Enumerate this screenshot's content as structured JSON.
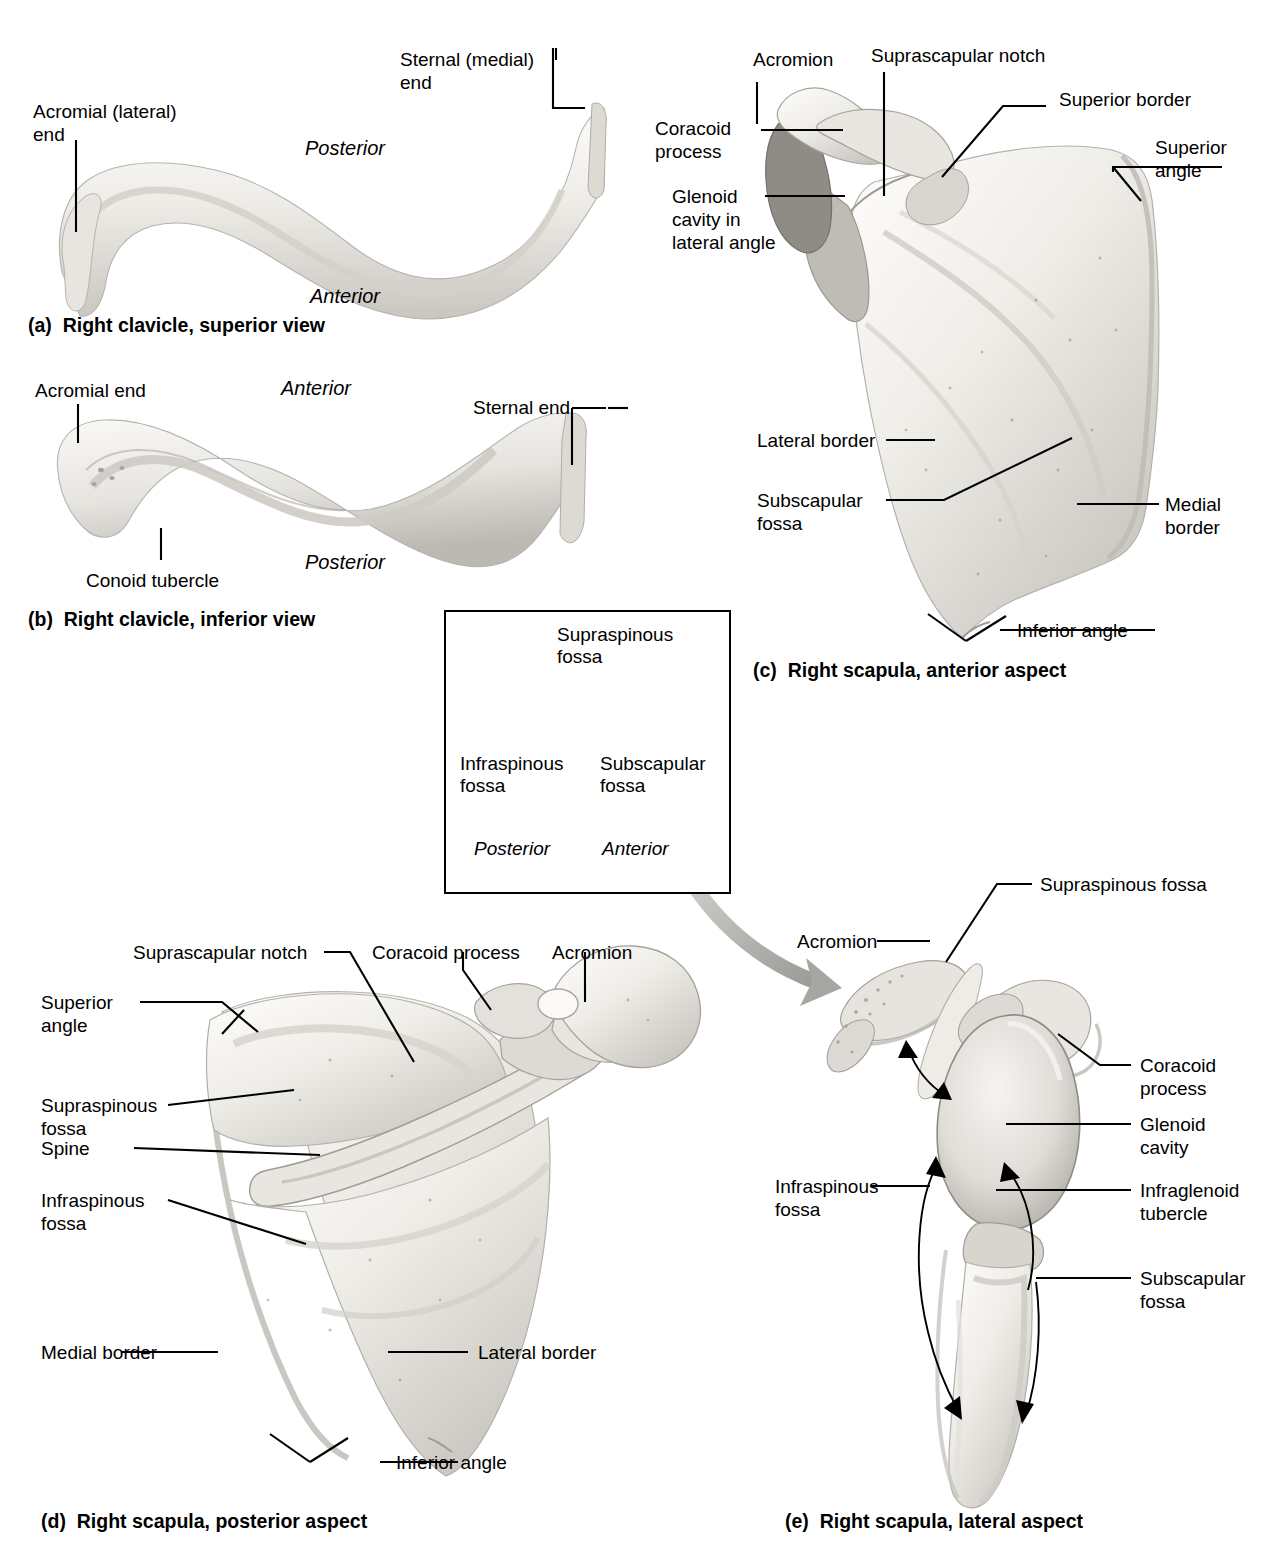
{
  "figure": {
    "background": "#ffffff",
    "bone_fill": "#f0eeea",
    "bone_shadow": "#b9b6b0",
    "inset_bar_fill": "#d4d2cd",
    "arrow_gray": "#a8a6a2"
  },
  "panels": [
    {
      "id": "a",
      "caption": "(a)  Right clavicle, superior view",
      "labels": [
        {
          "name": "acromial-lateral-end",
          "text": "Acromial (lateral)\nend"
        },
        {
          "name": "sternal-medial-end",
          "text": "Sternal (medial)\nend"
        },
        {
          "name": "posterior",
          "text": "Posterior",
          "italic": true
        },
        {
          "name": "anterior",
          "text": "Anterior",
          "italic": true
        }
      ]
    },
    {
      "id": "b",
      "caption": "(b)  Right clavicle, inferior view",
      "labels": [
        {
          "name": "acromial-end",
          "text": "Acromial end"
        },
        {
          "name": "anterior",
          "text": "Anterior",
          "italic": true
        },
        {
          "name": "sternal-end",
          "text": "Sternal end"
        },
        {
          "name": "posterior",
          "text": "Posterior",
          "italic": true
        },
        {
          "name": "conoid-tubercle",
          "text": "Conoid tubercle"
        }
      ]
    },
    {
      "id": "c",
      "caption": "(c)  Right scapula, anterior aspect",
      "labels": [
        {
          "name": "acromion",
          "text": "Acromion"
        },
        {
          "name": "suprascapular-notch",
          "text": "Suprascapular notch"
        },
        {
          "name": "superior-border",
          "text": "Superior border"
        },
        {
          "name": "coracoid-process",
          "text": "Coracoid\nprocess"
        },
        {
          "name": "superior-angle",
          "text": "Superior\nangle"
        },
        {
          "name": "glenoid-cavity-lateral-angle",
          "text": "Glenoid\ncavity in\nlateral angle"
        },
        {
          "name": "lateral-border",
          "text": "Lateral border"
        },
        {
          "name": "subscapular-fossa",
          "text": "Subscapular\nfossa"
        },
        {
          "name": "medial-border",
          "text": "Medial\nborder"
        },
        {
          "name": "inferior-angle",
          "text": "Inferior angle"
        }
      ]
    },
    {
      "id": "d",
      "caption": "(d)  Right scapula, posterior aspect",
      "labels": [
        {
          "name": "suprascapular-notch",
          "text": "Suprascapular notch"
        },
        {
          "name": "coracoid-process",
          "text": "Coracoid process"
        },
        {
          "name": "acromion",
          "text": "Acromion"
        },
        {
          "name": "superior-angle",
          "text": "Superior\nangle"
        },
        {
          "name": "supraspinous-fossa",
          "text": "Supraspinous\nfossa"
        },
        {
          "name": "spine",
          "text": "Spine"
        },
        {
          "name": "infraspinous-fossa",
          "text": "Infraspinous\nfossa"
        },
        {
          "name": "medial-border",
          "text": "Medial border"
        },
        {
          "name": "lateral-border",
          "text": "Lateral border"
        },
        {
          "name": "inferior-angle",
          "text": "Inferior angle"
        }
      ]
    },
    {
      "id": "e",
      "caption": "(e)  Right scapula, lateral aspect",
      "labels": [
        {
          "name": "supraspinous-fossa",
          "text": "Supraspinous fossa"
        },
        {
          "name": "acromion",
          "text": "Acromion"
        },
        {
          "name": "coracoid-process",
          "text": "Coracoid\nprocess"
        },
        {
          "name": "glenoid-cavity",
          "text": "Glenoid\ncavity"
        },
        {
          "name": "infraglenoid-tubercle",
          "text": "Infraglenoid\ntubercle"
        },
        {
          "name": "infraspinous-fossa",
          "text": "Infraspinous\nfossa"
        },
        {
          "name": "subscapular-fossa",
          "text": "Subscapular\nfossa"
        }
      ]
    }
  ],
  "inset": {
    "name": "scapula-cross-section-schematic",
    "labels": [
      {
        "name": "supraspinous-fossa",
        "text": "Supraspinous\nfossa"
      },
      {
        "name": "infraspinous-fossa",
        "text": "Infraspinous\nfossa"
      },
      {
        "name": "subscapular-fossa",
        "text": "Subscapular\nfossa"
      },
      {
        "name": "posterior",
        "text": "Posterior",
        "italic": true
      },
      {
        "name": "anterior",
        "text": "Anterior",
        "italic": true
      }
    ]
  }
}
